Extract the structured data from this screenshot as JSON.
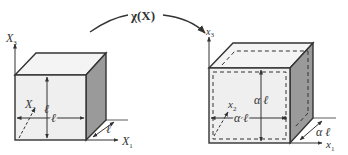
{
  "diagram": {
    "mapping_label": "χ(X)",
    "colors": {
      "stroke": "#333333",
      "front_face": "#efefef",
      "top_face": "#f4f4f4",
      "side_face": "#9a9a9a",
      "background": "#ffffff"
    },
    "reference_cube": {
      "axes": {
        "x1": "X",
        "x1_sub": "1",
        "x2": "X",
        "x2_sub": "2",
        "x3": "X",
        "x3_sub": "3"
      },
      "edge_labels": {
        "vertical": "ℓ",
        "horizontal": "ℓ",
        "depth": "ℓ"
      }
    },
    "deformed_cube": {
      "axes": {
        "x1": "x",
        "x1_sub": "1",
        "x2": "x",
        "x2_sub": "2",
        "x3": "x",
        "x3_sub": "3"
      },
      "edge_labels": {
        "vertical": "α ℓ",
        "horizontal": "α ℓ",
        "depth": "α ℓ"
      },
      "outline_style": "dashed inner outline showing original cube"
    }
  }
}
